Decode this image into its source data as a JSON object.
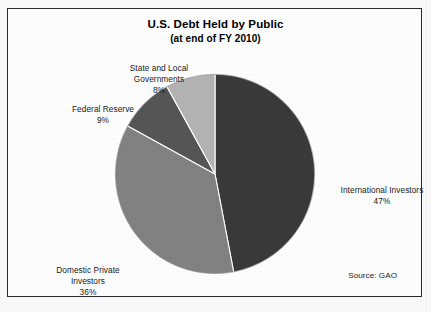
{
  "figure": {
    "title": "U.S. Debt Held by Public",
    "subtitle": "(at end of FY 2010)",
    "source_note": "Source: GAO",
    "frame_color": "#2b2b2b",
    "background_color": "#ffffff"
  },
  "labels": {
    "state_local": {
      "name": "State and Local\nGovernments",
      "pct": "8%"
    },
    "federal_reserve": {
      "name": "Federal Reserve",
      "pct": "9%"
    },
    "international": {
      "name": "International Investors",
      "pct": "47%"
    },
    "domestic_private": {
      "name": "Domestic Private\nInvestors",
      "pct": "36%"
    }
  },
  "chart_data": {
    "type": "pie",
    "title": "U.S. Debt Held by Public",
    "subtitle": "(at end of FY 2010)",
    "xlabel": "",
    "ylabel": "",
    "units": "percent",
    "total": 100,
    "start_angle_deg": 0,
    "direction": "clockwise",
    "legend": "none (labels placed outside slices)",
    "grid": false,
    "source": "Source: GAO",
    "categories": [
      "International Investors",
      "Domestic Private Investors",
      "Federal Reserve",
      "State and Local Governments"
    ],
    "values": [
      47,
      36,
      9,
      8
    ],
    "colors": [
      "#3a3a3a",
      "#828282",
      "#565656",
      "#b4b4b4"
    ],
    "slices": [
      {
        "label": "International Investors",
        "value": 47,
        "display": "47%",
        "color": "#3a3a3a",
        "start_deg": 0,
        "end_deg": 169.2
      },
      {
        "label": "Domestic Private Investors",
        "value": 36,
        "display": "36%",
        "color": "#828282",
        "start_deg": 169.2,
        "end_deg": 298.8
      },
      {
        "label": "Federal Reserve",
        "value": 9,
        "display": "9%",
        "color": "#565656",
        "start_deg": 298.8,
        "end_deg": 331.2
      },
      {
        "label": "State and Local Governments",
        "value": 8,
        "display": "8%",
        "color": "#b4b4b4",
        "start_deg": 331.2,
        "end_deg": 360
      }
    ]
  }
}
